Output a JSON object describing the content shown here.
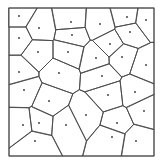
{
  "diagram": {
    "type": "voronoi",
    "width": 163,
    "height": 165,
    "bbox": {
      "x0": 9,
      "y0": 8,
      "x1": 154,
      "y1": 156
    },
    "colors": {
      "edge": "#4a4a4a",
      "border": "#5a5a5a",
      "site": "#333333",
      "background": "#ffffff"
    },
    "sites": [
      [
        19,
        16
      ],
      [
        39,
        28
      ],
      [
        19,
        38
      ],
      [
        38,
        52
      ],
      [
        71,
        22
      ],
      [
        72,
        35
      ],
      [
        68,
        52
      ],
      [
        19,
        72
      ],
      [
        59,
        73
      ],
      [
        127,
        17
      ],
      [
        146,
        20
      ],
      [
        100,
        24
      ],
      [
        130,
        32
      ],
      [
        110,
        44
      ],
      [
        96,
        58
      ],
      [
        122,
        57
      ],
      [
        146,
        65
      ],
      [
        102,
        76
      ],
      [
        24,
        90
      ],
      [
        49,
        101
      ],
      [
        23,
        125
      ],
      [
        39,
        123
      ],
      [
        66,
        125
      ],
      [
        35,
        141
      ],
      [
        108,
        95
      ],
      [
        135,
        92
      ],
      [
        86,
        115
      ],
      [
        144,
        111
      ],
      [
        117,
        123
      ],
      [
        112,
        137
      ],
      [
        136,
        141
      ]
    ]
  }
}
